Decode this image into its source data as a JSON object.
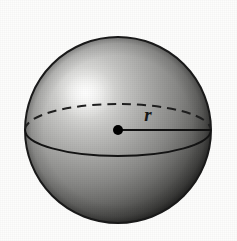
{
  "figure": {
    "name": "sphere-with-radius",
    "caption_text": "",
    "background_color": "#fdfdfc"
  },
  "labels": {
    "radius": "r"
  },
  "geometry": {
    "center_x": 118,
    "center_y": 130,
    "radius_px": 93,
    "equator_rx": 93,
    "equator_ry": 26,
    "radius_line_start_x": 118,
    "radius_line_start_y": 130,
    "radius_line_end_x": 211,
    "radius_line_end_y": 130,
    "center_dot_radius": 5,
    "label_x": 148,
    "label_y": 120,
    "highlight_x": 85,
    "highlight_y": 93,
    "highlight_r": 30
  },
  "colors": {
    "outline": "#1a1a1a",
    "equator_solid": "#141414",
    "equator_dashed": "#1f1f1f",
    "radius_line": "#111111",
    "center_dot": "#000000",
    "label_color": "#161616",
    "sphere_light": "#f2f2f0",
    "sphere_mid": "#9a9a98",
    "sphere_dark": "#3a3a39",
    "sphere_darkest": "#232322"
  },
  "style": {
    "outline_width": 2,
    "equator_width": 2,
    "radius_line_width": 2,
    "dash_pattern": "9 6"
  }
}
